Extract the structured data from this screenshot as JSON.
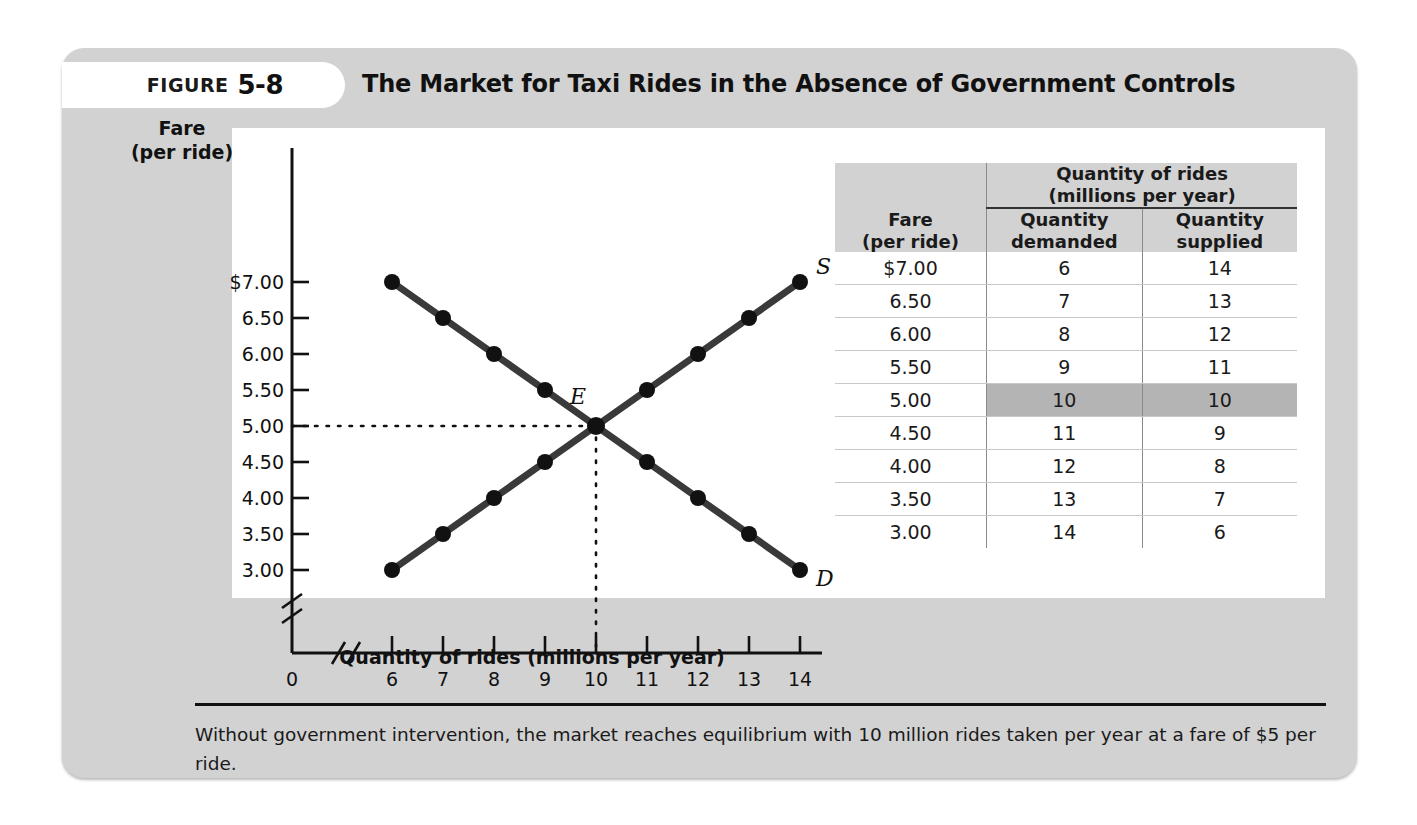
{
  "figure": {
    "label_word": "Figure",
    "number": "5-8",
    "title": "The Market for Taxi Rides in the Absence of Government Controls",
    "caption": "Without government intervention, the market reaches equilibrium with 10 million rides taken per year at a fare of $5 per ride."
  },
  "axes": {
    "y_title_line1": "Fare",
    "y_title_line2": "(per ride)",
    "x_title": "Quantity of rides (millions per year)",
    "origin_label": "0"
  },
  "table": {
    "group_header_line1": "Quantity of rides",
    "group_header_line2": "(millions per year)",
    "col_fare_line1": "Fare",
    "col_fare_line2": "(per ride)",
    "col_demanded_line1": "Quantity",
    "col_demanded_line2": "demanded",
    "col_supplied_line1": "Quantity",
    "col_supplied_line2": "supplied",
    "rows": [
      {
        "fare": "$7.00",
        "demanded": "6",
        "supplied": "14",
        "highlight": false
      },
      {
        "fare": "6.50",
        "demanded": "7",
        "supplied": "13",
        "highlight": false
      },
      {
        "fare": "6.00",
        "demanded": "8",
        "supplied": "12",
        "highlight": false
      },
      {
        "fare": "5.50",
        "demanded": "9",
        "supplied": "11",
        "highlight": false
      },
      {
        "fare": "5.00",
        "demanded": "10",
        "supplied": "10",
        "highlight": true
      },
      {
        "fare": "4.50",
        "demanded": "11",
        "supplied": "9",
        "highlight": false
      },
      {
        "fare": "4.00",
        "demanded": "12",
        "supplied": "8",
        "highlight": false
      },
      {
        "fare": "3.50",
        "demanded": "13",
        "supplied": "7",
        "highlight": false
      },
      {
        "fare": "3.00",
        "demanded": "14",
        "supplied": "6",
        "highlight": false
      }
    ]
  },
  "chart_data": {
    "type": "line",
    "title": "The Market for Taxi Rides in the Absence of Government Controls",
    "xlabel": "Quantity of rides (millions per year)",
    "ylabel": "Fare (per ride)",
    "x": [
      6,
      7,
      8,
      9,
      10,
      11,
      12,
      13,
      14
    ],
    "xtick_labels": [
      "6",
      "7",
      "8",
      "9",
      "10",
      "11",
      "12",
      "13",
      "14"
    ],
    "ytick_labels": [
      "$7.00",
      "6.50",
      "6.00",
      "5.50",
      "5.00",
      "4.50",
      "4.00",
      "3.50",
      "3.00"
    ],
    "ytick_values": [
      7.0,
      6.5,
      6.0,
      5.5,
      5.0,
      4.5,
      4.0,
      3.5,
      3.0
    ],
    "xlim": [
      6,
      14
    ],
    "ylim": [
      3.0,
      7.0
    ],
    "axis_break_x": true,
    "axis_break_y": true,
    "grid": false,
    "legend": "inline-curve-labels",
    "series": [
      {
        "name": "D",
        "label": "D",
        "description": "Demand curve",
        "points": [
          {
            "x": 6,
            "y": 7.0
          },
          {
            "x": 7,
            "y": 6.5
          },
          {
            "x": 8,
            "y": 6.0
          },
          {
            "x": 9,
            "y": 5.5
          },
          {
            "x": 10,
            "y": 5.0
          },
          {
            "x": 11,
            "y": 4.5
          },
          {
            "x": 12,
            "y": 4.0
          },
          {
            "x": 13,
            "y": 3.5
          },
          {
            "x": 14,
            "y": 3.0
          }
        ]
      },
      {
        "name": "S",
        "label": "S",
        "description": "Supply curve",
        "points": [
          {
            "x": 6,
            "y": 3.0
          },
          {
            "x": 7,
            "y": 3.5
          },
          {
            "x": 8,
            "y": 4.0
          },
          {
            "x": 9,
            "y": 4.5
          },
          {
            "x": 10,
            "y": 5.0
          },
          {
            "x": 11,
            "y": 5.5
          },
          {
            "x": 12,
            "y": 6.0
          },
          {
            "x": 13,
            "y": 6.5
          },
          {
            "x": 14,
            "y": 7.0
          }
        ]
      }
    ],
    "annotations": [
      {
        "label": "E",
        "description": "Equilibrium point",
        "x": 10,
        "y": 5.0,
        "guides": "dotted lines to both axes"
      }
    ]
  },
  "colors": {
    "card_background": "#d2d2d2",
    "panel_background": "#ffffff",
    "curve": "#3a3a3a",
    "marker": "#111111",
    "highlight_row": "#b4b4b4",
    "text": "#111111"
  }
}
